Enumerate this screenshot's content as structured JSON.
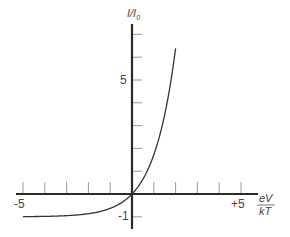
{
  "chart_data": {
    "type": "line",
    "title": "",
    "xlabel": {
      "numerator": "eV",
      "denominator": "kT"
    },
    "ylabel": {
      "main": "I/I",
      "subscript": "0"
    },
    "xlim": [
      -5,
      5
    ],
    "ylim": [
      -1.5,
      7.5
    ],
    "x_ticks": [
      -5,
      -4,
      -3,
      -2,
      -1,
      1,
      2,
      3,
      4,
      5
    ],
    "y_ticks": [
      -1,
      1,
      2,
      3,
      4,
      5,
      6,
      7
    ],
    "x_tick_labels": [
      {
        "value": -5,
        "text": "-5"
      },
      {
        "value": 5,
        "text": "+5"
      }
    ],
    "y_tick_labels": [
      {
        "value": 5,
        "text": "5"
      },
      {
        "value": -1,
        "text": "-1"
      }
    ],
    "grid": false,
    "legend": null,
    "series": [
      {
        "name": "diode current I/I0 = exp(eV/kT) - 1",
        "x": [
          -5,
          -4,
          -3,
          -2,
          -1.5,
          -1,
          -0.5,
          0,
          0.5,
          1,
          1.25,
          1.5,
          1.75,
          2
        ],
        "y": [
          -0.99,
          -0.98,
          -0.95,
          -0.86,
          -0.78,
          -0.63,
          -0.39,
          0,
          0.65,
          1.72,
          2.49,
          3.48,
          4.75,
          6.39
        ]
      }
    ],
    "colors": {
      "axis": "#2a2a2a",
      "curve": "#333333",
      "tick": "#9a9a9a",
      "text": "#444444"
    }
  },
  "labels": {
    "y_axis_main": "I/I",
    "y_axis_sub": "0",
    "x_axis_num": "eV",
    "x_axis_den": "kT",
    "x_min": "-5",
    "x_max": "+5",
    "y_five": "5",
    "y_minus_one": "-1"
  }
}
